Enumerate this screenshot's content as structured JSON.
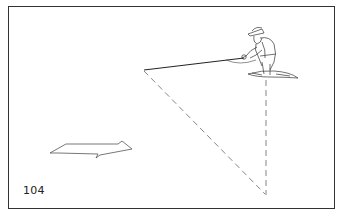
{
  "figure": {
    "number_label": "104",
    "elements": [
      "angler-figure",
      "fly-line",
      "dashed-diagonal",
      "dashed-vertical",
      "direction-arrow"
    ],
    "colors": {
      "line": "#222222",
      "dashed": "#777777",
      "background": "#ffffff",
      "frame": "#333333"
    }
  }
}
